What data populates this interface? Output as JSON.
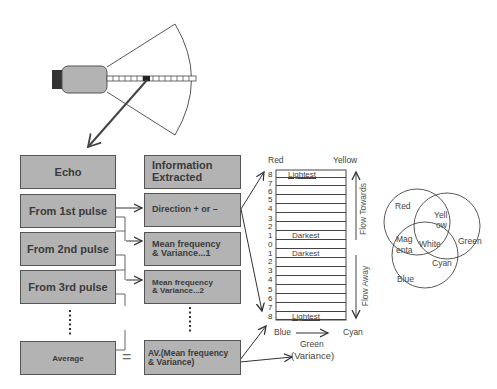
{
  "columns": {
    "echo_header": "Echo",
    "info_header_line1": "Information",
    "info_header_line2": "Extracted"
  },
  "echo_boxes": [
    "From 1st pulse",
    "From 2nd pulse",
    "From 3rd pulse",
    "Average"
  ],
  "info_boxes": [
    {
      "line1": "Direction + or –",
      "line2": ""
    },
    {
      "line1": "Mean frequency",
      "line2": "& Variance...1"
    },
    {
      "line1": "Mean frequency",
      "line2": "& Variance...2"
    },
    {
      "line1": "AV.(Mean frequency",
      "line2": "& Variance)"
    }
  ],
  "equals_sign": "=",
  "ellipsis": "⋮",
  "scale": {
    "top_left_label": "Red",
    "top_right_label": "Yellow",
    "numbers": [
      "8",
      "7",
      "6",
      "5",
      "4",
      "3",
      "2",
      "1",
      "0",
      "1",
      "2",
      "3",
      "4",
      "5",
      "6",
      "7",
      "8"
    ],
    "lightest_label": "Lightest",
    "darkest_label": "Darkest",
    "flow_towards": "Flow Towards",
    "flow_away": "Flow Away",
    "bottom_left_label": "Blue",
    "bottom_right_label": "Cyan",
    "green_label": "Green",
    "variance_label": "(Variance)"
  },
  "venn": {
    "red": "Red",
    "green": "Green",
    "blue": "Blue",
    "yellow_line1": "Yell",
    "yellow_line2": "ow",
    "magenta_line1": "Mag",
    "magenta_line2": "enta",
    "white": "White",
    "cyan": "Cyan"
  },
  "colors": {
    "box_fill": "#b3b3b3",
    "box_border": "#555555",
    "line": "#333333"
  }
}
